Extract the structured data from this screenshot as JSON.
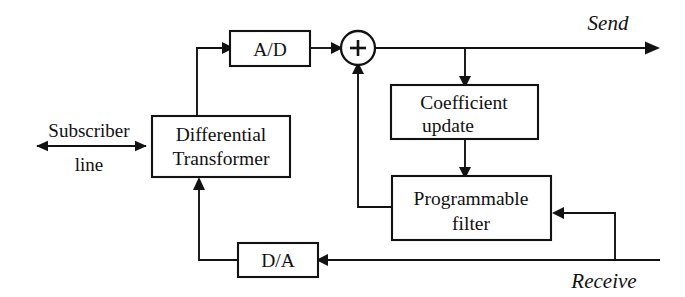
{
  "diagram": {
    "background_color": "#ffffff",
    "line_color": "#121212",
    "blocks": [
      {
        "id": "differential-transformer",
        "lines": [
          "Differential",
          "Transformer"
        ],
        "x": 152,
        "y": 116,
        "w": 138,
        "h": 61
      },
      {
        "id": "ad-converter",
        "lines": [
          "A/D"
        ],
        "x": 230,
        "y": 31,
        "w": 80,
        "h": 35
      },
      {
        "id": "coefficient-update",
        "lines": [
          "Coefficient",
          "update"
        ],
        "x": 391,
        "y": 85,
        "w": 147,
        "h": 54
      },
      {
        "id": "programmable-filter",
        "lines": [
          "Programmable",
          "filter"
        ],
        "x": 392,
        "y": 176,
        "w": 159,
        "h": 64
      },
      {
        "id": "da-converter",
        "lines": [
          "D/A"
        ],
        "x": 238,
        "y": 243,
        "w": 80,
        "h": 34
      }
    ],
    "summing_node": {
      "id": "summing-junction",
      "symbol": "+",
      "cx": 358,
      "cy": 48,
      "r": 17
    },
    "io_labels": {
      "subscriber_line_1": "Subscriber",
      "subscriber_line_2": "line",
      "send": "Send",
      "receive": "Receive"
    },
    "block_text": {
      "differential_1": "Differential",
      "differential_2": "Transformer",
      "ad": "A/D",
      "coefficient_1": "Coefficient",
      "coefficient_2": "update",
      "programmable_1": "Programmable",
      "programmable_2": "filter",
      "da": "D/A"
    }
  }
}
